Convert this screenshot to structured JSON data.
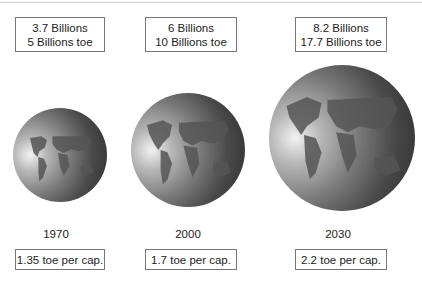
{
  "figure": {
    "columns": [
      {
        "population": "3.7 Billions",
        "energy": "5 Billions toe",
        "year": "1970",
        "per_capita": "1.35 toe per cap."
      },
      {
        "population": "6 Billions",
        "energy": "10 Billions toe",
        "year": "2000",
        "per_capita": "1.7 toe per cap."
      },
      {
        "population": "8.2 Billions",
        "energy": "17.7 Billions toe",
        "year": "2030",
        "per_capita": "2.2 toe per cap."
      }
    ],
    "icons": [
      "globe-icon",
      "globe-icon",
      "globe-icon"
    ],
    "colors": {
      "box_border": "#777777",
      "globe_dark": "#2a2a2a",
      "globe_light": "#f2f2f2"
    }
  }
}
